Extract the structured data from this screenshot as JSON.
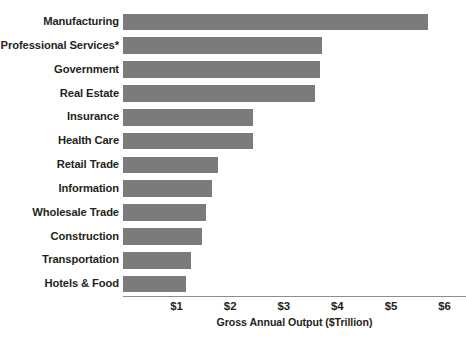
{
  "chart_data": {
    "type": "bar",
    "orientation": "horizontal",
    "title": "",
    "xlabel": "Gross Annual Output ($Trillion)",
    "ylabel": "",
    "xlim": [
      0,
      6.4
    ],
    "xticks": [
      1,
      2,
      3,
      4,
      5,
      6
    ],
    "xtick_labels": [
      "$1",
      "$2",
      "$3",
      "$4",
      "$5",
      "$6"
    ],
    "grid": false,
    "legend": null,
    "bar_color": "#7b7b7b",
    "axis_color": "#8d8d8d",
    "background": "#ffffff",
    "footnote_marker": "*",
    "categories": [
      "Manufacturing",
      "Professional Services*",
      "Government",
      "Real Estate",
      "Insurance",
      "Health Care",
      "Retail Trade",
      "Information",
      "Wholesale Trade",
      "Construction",
      "Transportation",
      "Hotels & Food"
    ],
    "values": [
      5.7,
      3.72,
      3.67,
      3.59,
      2.43,
      2.43,
      1.77,
      1.66,
      1.55,
      1.48,
      1.26,
      1.18
    ],
    "units": "$Trillion"
  }
}
